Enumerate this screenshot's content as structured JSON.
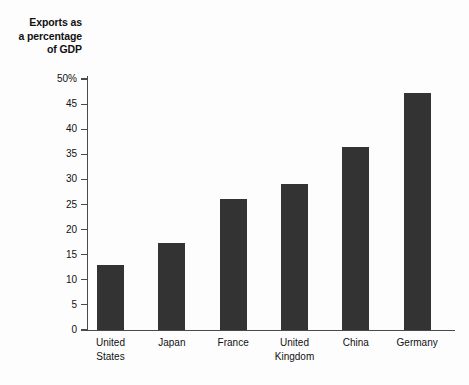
{
  "chart_data": {
    "type": "bar",
    "title": "Exports as a percentage of GDP",
    "title_lines": [
      "Exports as",
      "a percentage",
      "of GDP"
    ],
    "categories": [
      "United States",
      "Japan",
      "France",
      "United Kingdom",
      "China",
      "Germany"
    ],
    "category_lines": [
      [
        "United",
        "States"
      ],
      [
        "Japan"
      ],
      [
        "France"
      ],
      [
        "United",
        "Kingdom"
      ],
      [
        "China"
      ],
      [
        "Germany"
      ]
    ],
    "values": [
      13,
      17.3,
      26.1,
      29,
      36.4,
      47.2
    ],
    "xlabel": "",
    "ylabel": "Exports as a percentage of GDP",
    "ylim": [
      0,
      50
    ],
    "ytick_values": [
      0,
      5,
      10,
      15,
      20,
      25,
      30,
      35,
      40,
      45,
      50
    ],
    "ytick_labels": [
      "0",
      "5",
      "10",
      "15",
      "20",
      "25",
      "30",
      "35",
      "40",
      "45",
      "50%"
    ],
    "grid": false,
    "legend": false,
    "bar_color": "#333333",
    "axis_color": "#4a4a4a",
    "background_color": "#fdfdfd"
  }
}
